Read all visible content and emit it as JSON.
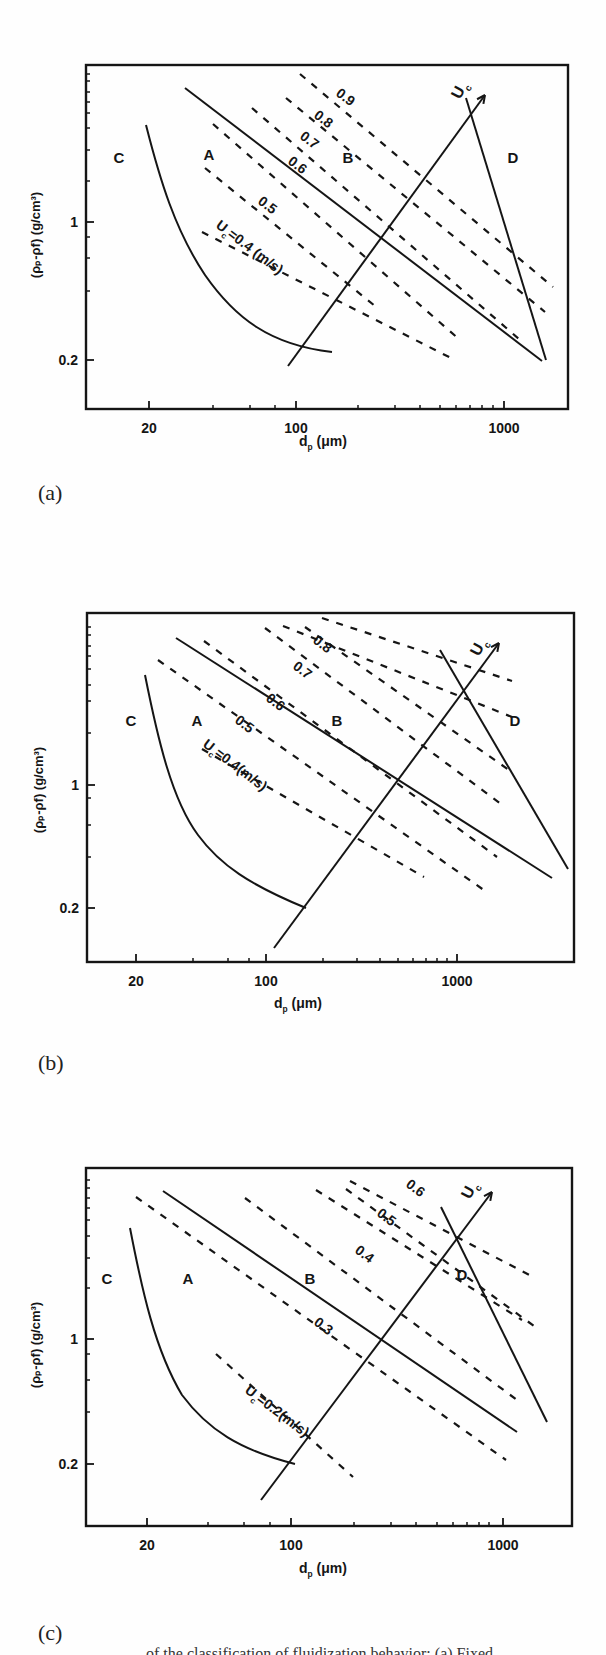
{
  "figure": {
    "panels": [
      {
        "label": "(a)"
      },
      {
        "label": "(b)"
      },
      {
        "label": "(c)"
      }
    ],
    "caption": "... of the classification of fluidization behavior; (a) Fixed ..."
  },
  "chart_data": [
    {
      "type": "line",
      "panel": "(a)",
      "title": "",
      "xlabel": "d_p (μm)",
      "ylabel": "(ρ_p-ρ_f) (g/cm³)",
      "xscale": "log",
      "yscale": "log",
      "xticks": [
        "20",
        "100",
        "1000"
      ],
      "yticks": [
        "0.2",
        "1"
      ],
      "xlim": [
        10,
        2000
      ],
      "ylim": [
        0.1,
        8
      ],
      "regions": [
        "A",
        "B",
        "C",
        "D"
      ],
      "solid_lines": [
        "C/A boundary",
        "A/B boundary",
        "B/D boundary",
        "U_c arrow"
      ],
      "dashed_series": [
        {
          "name": "U_c=0.4 (m/s)",
          "value": 0.4
        },
        {
          "name": "0.5",
          "value": 0.5
        },
        {
          "name": "0.6",
          "value": 0.6
        },
        {
          "name": "0.7",
          "value": 0.7
        },
        {
          "name": "0.8",
          "value": 0.8
        },
        {
          "name": "0.9",
          "value": 0.9
        }
      ],
      "annotation": "U_c"
    },
    {
      "type": "line",
      "panel": "(b)",
      "title": "",
      "xlabel": "d_p (μm)",
      "ylabel": "(ρ_p-ρ_f) (g/cm³)",
      "xscale": "log",
      "yscale": "log",
      "xticks": [
        "20",
        "100",
        "1000"
      ],
      "yticks": [
        "0.2",
        "1"
      ],
      "xlim": [
        10,
        2000
      ],
      "ylim": [
        0.1,
        8
      ],
      "regions": [
        "A",
        "B",
        "C",
        "D"
      ],
      "solid_lines": [
        "C/A boundary",
        "A/B boundary",
        "B/D boundary",
        "U_c arrow"
      ],
      "dashed_series": [
        {
          "name": "U_c=0.4(m/s)",
          "value": 0.4
        },
        {
          "name": "0.5",
          "value": 0.5
        },
        {
          "name": "0.6",
          "value": 0.6
        },
        {
          "name": "0.7",
          "value": 0.7
        },
        {
          "name": "0.8",
          "value": 0.8
        }
      ],
      "annotation": "U_c"
    },
    {
      "type": "line",
      "panel": "(c)",
      "title": "",
      "xlabel": "d_p (μm)",
      "ylabel": "(ρ_p-ρ_f) (g/cm³)",
      "xscale": "log",
      "yscale": "log",
      "xticks": [
        "20",
        "100",
        "1000"
      ],
      "yticks": [
        "0.2",
        "1"
      ],
      "xlim": [
        10,
        2000
      ],
      "ylim": [
        0.1,
        8
      ],
      "regions": [
        "A",
        "B",
        "C",
        "D"
      ],
      "solid_lines": [
        "C/A boundary",
        "A/B boundary",
        "B/D boundary",
        "U_c arrow"
      ],
      "dashed_series": [
        {
          "name": "U_c=0.2(m/s)",
          "value": 0.2
        },
        {
          "name": "0.3",
          "value": 0.3
        },
        {
          "name": "0.4",
          "value": 0.4
        },
        {
          "name": "0.5",
          "value": 0.5
        },
        {
          "name": "0.6",
          "value": 0.6
        }
      ],
      "annotation": "U_c"
    }
  ],
  "render": {
    "ink": "#151515",
    "panels": [
      {
        "top": 0,
        "frame": {
          "x1": 86,
          "y1": 65,
          "x2": 568,
          "y2": 409
        },
        "xticks": [
          {
            "x": 149,
            "label": "20",
            "major": true
          },
          {
            "x": 296,
            "label": "100",
            "major": true
          },
          {
            "x": 504,
            "label": "1000",
            "major": true
          }
        ],
        "xminor": [
          213,
          250,
          275,
          358,
          395,
          420,
          440,
          456,
          470,
          482,
          493
        ],
        "yticks": [
          {
            "y": 222,
            "label": "1",
            "major": true
          },
          {
            "y": 360,
            "label": "0.2",
            "major": true
          }
        ],
        "yminor": [
          74,
          81,
          92,
          102,
          113,
          128,
          150,
          181,
          237,
          258,
          291
        ],
        "xlabel": {
          "x": 327,
          "y": 446,
          "main": "d",
          "sub": "p",
          "rest": " (μm)"
        },
        "ylabel": {
          "x": 40,
          "y": 235
        },
        "regions": [
          {
            "t": "C",
            "x": 119,
            "y": 163
          },
          {
            "t": "A",
            "x": 209,
            "y": 160
          },
          {
            "t": "B",
            "x": 348,
            "y": 163
          },
          {
            "t": "D",
            "x": 513,
            "y": 163
          }
        ],
        "curve": "M146,125 C160,180 175,230 205,275 C235,318 270,345 332,352",
        "solids": [
          [
            185,
            88,
            542,
            361
          ],
          [
            466,
            98,
            546,
            360
          ],
          [
            288,
            366,
            485,
            95
          ]
        ],
        "arrow": [
          288,
          366,
          485,
          95
        ],
        "dashes": [
          [
            202,
            232,
            451,
            358
          ],
          [
            205,
            168,
            375,
            306
          ],
          [
            213,
            124,
            460,
            340
          ],
          [
            252,
            108,
            519,
            339
          ],
          [
            286,
            98,
            545,
            312
          ],
          [
            300,
            74,
            553,
            287
          ]
        ],
        "dlabels": [
          {
            "t": "U",
            "sub": "c",
            "rest": "=0.4 (m/s)",
            "x": 215,
            "y": 227,
            "rot": 37
          },
          {
            "t": "0.5",
            "x": 257,
            "y": 203,
            "rot": 37
          },
          {
            "t": "0.6",
            "x": 287,
            "y": 163,
            "rot": 37
          },
          {
            "t": "0.7",
            "x": 299,
            "y": 138,
            "rot": 37
          },
          {
            "t": "0.8",
            "x": 313,
            "y": 117,
            "rot": 37
          },
          {
            "t": "0.9",
            "x": 335,
            "y": 95,
            "rot": 37
          }
        ],
        "uc": {
          "t": "U",
          "sub": "c",
          "x": 460,
          "y": 100,
          "rot": -62
        },
        "label": {
          "x": 38,
          "y": 480
        }
      },
      {
        "top": 0,
        "frame": {
          "x1": 87,
          "y1": 613,
          "x2": 574,
          "y2": 962
        },
        "xticks": [
          {
            "x": 136,
            "label": "20",
            "major": true
          },
          {
            "x": 266,
            "label": "100",
            "major": true
          },
          {
            "x": 457,
            "label": "1000",
            "major": true
          }
        ],
        "xminor": [
          193,
          228,
          249,
          323,
          357,
          380,
          398,
          413,
          426,
          437,
          447
        ],
        "yticks": [
          {
            "y": 785,
            "label": "1",
            "major": true
          },
          {
            "y": 908,
            "label": "0.2",
            "major": true
          }
        ],
        "yminor": [
          627,
          635,
          646,
          656,
          669,
          685,
          701,
          733,
          798,
          825,
          857
        ],
        "xlabel": {
          "x": 302,
          "y": 1008,
          "main": "d",
          "sub": "p",
          "rest": " (μm)"
        },
        "ylabel": {
          "x": 43,
          "y": 790
        },
        "regions": [
          {
            "t": "C",
            "x": 131,
            "y": 726
          },
          {
            "t": "A",
            "x": 197,
            "y": 726
          },
          {
            "t": "B",
            "x": 337,
            "y": 726
          },
          {
            "t": "D",
            "x": 515,
            "y": 726
          }
        ],
        "curve": "M145,675 C158,740 172,800 198,835 C220,865 250,885 306,908",
        "solids": [
          [
            176,
            638,
            552,
            878
          ],
          [
            440,
            650,
            568,
            869
          ],
          [
            274,
            948,
            499,
            643
          ]
        ],
        "arrow": [
          274,
          948,
          499,
          643
        ],
        "dashes": [
          [
            202,
            749,
            424,
            877
          ],
          [
            158,
            660,
            488,
            893
          ],
          [
            204,
            641,
            497,
            857
          ],
          [
            265,
            628,
            501,
            804
          ],
          [
            305,
            627,
            509,
            770
          ],
          [
            283,
            626,
            512,
            717
          ],
          [
            322,
            618,
            512,
            681
          ]
        ],
        "dlabels": [
          {
            "t": "U",
            "sub": "c",
            "rest": "=0.4(m/s)",
            "x": 202,
            "y": 746,
            "rot": 37
          },
          {
            "t": "0.5",
            "x": 234,
            "y": 722,
            "rot": 37
          },
          {
            "t": "0.6",
            "x": 265,
            "y": 700,
            "rot": 37
          },
          {
            "t": "0.7",
            "x": 292,
            "y": 668,
            "rot": 37
          },
          {
            "t": "0.8",
            "x": 312,
            "y": 642,
            "rot": 37
          }
        ],
        "uc": {
          "t": "U",
          "sub": "c",
          "x": 479,
          "y": 657,
          "rot": -62
        },
        "label": {
          "x": 38,
          "y": 1050
        }
      },
      {
        "top": 0,
        "frame": {
          "x1": 86,
          "y1": 1168,
          "x2": 572,
          "y2": 1526
        },
        "xticks": [
          {
            "x": 147,
            "label": "20",
            "major": true
          },
          {
            "x": 291,
            "label": "100",
            "major": true
          },
          {
            "x": 503,
            "label": "1000",
            "major": true
          }
        ],
        "xminor": [
          208,
          244,
          270,
          354,
          391,
          416,
          437,
          453,
          467,
          479,
          489
        ],
        "yticks": [
          {
            "y": 1339,
            "label": "1",
            "major": true
          },
          {
            "y": 1464,
            "label": "0.2",
            "major": true
          }
        ],
        "yminor": [
          1180,
          1188,
          1198,
          1208,
          1220,
          1236,
          1258,
          1288,
          1354,
          1380,
          1412
        ],
        "xlabel": {
          "x": 327,
          "y": 1573,
          "main": "d",
          "sub": "p",
          "rest": " (μm)"
        },
        "ylabel": {
          "x": 40,
          "y": 1345
        },
        "regions": [
          {
            "t": "C",
            "x": 107,
            "y": 1284
          },
          {
            "t": "A",
            "x": 188,
            "y": 1284
          },
          {
            "t": "B",
            "x": 310,
            "y": 1284
          },
          {
            "t": "D",
            "x": 462,
            "y": 1280
          }
        ],
        "curve": "M130,1228 C142,1290 155,1350 182,1395 C208,1430 240,1450 295,1464",
        "solids": [
          [
            163,
            1191,
            517,
            1432
          ],
          [
            441,
            1207,
            547,
            1422
          ],
          [
            261,
            1500,
            492,
            1192
          ]
        ],
        "arrow": [
          261,
          1500,
          492,
          1192
        ],
        "dashes": [
          [
            216,
            1354,
            353,
            1477
          ],
          [
            136,
            1197,
            506,
            1460
          ],
          [
            245,
            1198,
            517,
            1400
          ],
          [
            316,
            1190,
            522,
            1320
          ],
          [
            346,
            1189,
            534,
            1326
          ],
          [
            350,
            1181,
            535,
            1278
          ]
        ],
        "dlabels": [
          {
            "t": "U",
            "sub": "c",
            "rest": "=0.2(m/s)",
            "x": 244,
            "y": 1392,
            "rot": 37
          },
          {
            "t": "0.3",
            "x": 313,
            "y": 1324,
            "rot": 37
          },
          {
            "t": "0.4",
            "x": 354,
            "y": 1252,
            "rot": 37
          },
          {
            "t": "0.5",
            "x": 376,
            "y": 1215,
            "rot": 37
          },
          {
            "t": "0.6",
            "x": 405,
            "y": 1186,
            "rot": 37
          }
        ],
        "uc": {
          "t": "U",
          "sub": "c",
          "x": 470,
          "y": 1200,
          "rot": -62
        },
        "label": {
          "x": 38,
          "y": 1620
        }
      }
    ]
  }
}
